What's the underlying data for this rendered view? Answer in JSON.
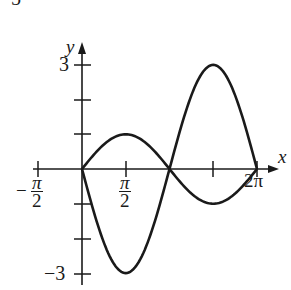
{
  "problem_number_fragment": "5",
  "chart_data": {
    "type": "line",
    "title": "",
    "xlabel": "x",
    "ylabel": "y",
    "xlim": [
      -1.5708,
      6.2832
    ],
    "ylim": [
      -3,
      3
    ],
    "grid": false,
    "legend": null,
    "x_ticks": [
      {
        "value": -1.5708,
        "label_num": "π",
        "label_den": "2",
        "label_sign": "−"
      },
      {
        "value": 1.5708,
        "label_num": "π",
        "label_den": "2",
        "label_sign": ""
      },
      {
        "value": 3.1416,
        "label": ""
      },
      {
        "value": 4.7124,
        "label": ""
      },
      {
        "value": 6.2832,
        "label": "2π"
      }
    ],
    "y_ticks": [
      {
        "value": 3,
        "label": "3"
      },
      {
        "value": 2,
        "label": ""
      },
      {
        "value": 1,
        "label": ""
      },
      {
        "value": -1,
        "label": ""
      },
      {
        "value": -2,
        "label": ""
      },
      {
        "value": -3,
        "label": "−3"
      }
    ],
    "series": [
      {
        "name": "y = sin x",
        "x": [
          0,
          0.7854,
          1.5708,
          2.3562,
          3.1416,
          3.927,
          4.7124,
          5.4978,
          6.2832
        ],
        "values": [
          0,
          0.707,
          1,
          0.707,
          0,
          -0.707,
          -1,
          -0.707,
          0
        ]
      },
      {
        "name": "y = -3 sin x",
        "x": [
          0,
          0.7854,
          1.5708,
          2.3562,
          3.1416,
          3.927,
          4.7124,
          5.4978,
          6.2832
        ],
        "values": [
          0,
          -2.121,
          -3,
          -2.121,
          0,
          2.121,
          3,
          2.121,
          0
        ]
      }
    ]
  },
  "labels": {
    "y_axis": "y",
    "x_axis": "x",
    "y_top": "3",
    "y_bottom": "−3",
    "x_neg_sign": "−",
    "x_neg_num": "π",
    "x_neg_den": "2",
    "x_pos_num": "π",
    "x_pos_den": "2",
    "x_end": "2π"
  },
  "style": {
    "ink": "#1a1a1a",
    "background": "#ffffff"
  }
}
